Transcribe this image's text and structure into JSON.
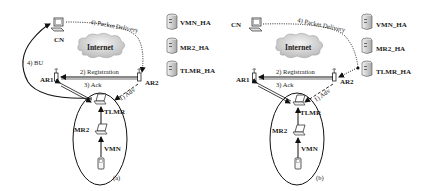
{
  "panels": [
    {
      "id": "a",
      "caption": "(a)",
      "cn_label": "CN",
      "internet_label": "Internet",
      "ar1_label": "AR1",
      "ar2_label": "AR2",
      "tlmr_label": "TLMR",
      "mr2_label": "MR2",
      "vmn_label": "VMN",
      "ha_labels": [
        "VMN_HA",
        "MR2_HA",
        "TLMR_HA"
      ],
      "msg_adv": "1) Adv",
      "msg_registration": "2) Registration",
      "msg_ack": "3) Ack",
      "msg_bu": "4) BU",
      "msg_packet_delivery": "4) Packet Delivery"
    },
    {
      "id": "b",
      "caption": "(b)",
      "cn_label": "CN",
      "internet_label": "Internet",
      "ar1_label": "AR1",
      "ar2_label": "AR2",
      "tlmr_label": "TLMR",
      "mr2_label": "MR2",
      "vmn_label": "VMN",
      "ha_labels": [
        "VMN_HA",
        "MR2_HA",
        "TLMR_HA"
      ],
      "msg_adv": "1) Adv",
      "msg_registration": "2) Registration",
      "msg_ack": "3) Ack",
      "msg_packet_delivery": "4) Packet Delivery"
    }
  ]
}
